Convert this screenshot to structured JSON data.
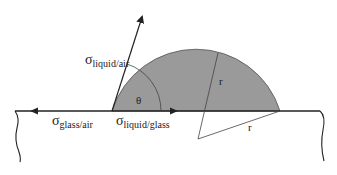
{
  "diagram": {
    "labels": {
      "sigma_liquid_air": {
        "symbol": "σ",
        "subscript": "liquid/air"
      },
      "sigma_glass_air": {
        "symbol": "σ",
        "subscript": "glass/air"
      },
      "sigma_liquid_glass": {
        "symbol": "σ",
        "subscript": "liquid/glass"
      },
      "theta": "θ",
      "radius_1": "r",
      "radius_2": "r"
    },
    "colors": {
      "drop_fill": "#9a9a9a",
      "line": "#222222",
      "background": "#ffffff"
    }
  }
}
